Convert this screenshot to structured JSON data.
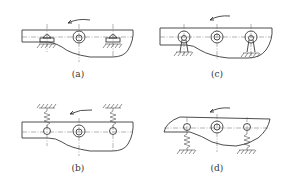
{
  "figure": {
    "panels": [
      {
        "id": "a",
        "label": "(a)",
        "support_type": "roller-on-ground",
        "rotation_arrow": "counterclockwise"
      },
      {
        "id": "b",
        "label": "(b)",
        "support_type": "spring-from-above",
        "rotation_arrow": "counterclockwise"
      },
      {
        "id": "c",
        "label": "(c)",
        "support_type": "pinned-link-to-ground",
        "rotation_arrow": "counterclockwise"
      },
      {
        "id": "d",
        "label": "(d)",
        "support_type": "spring-from-below",
        "rotation_arrow": "counterclockwise"
      }
    ]
  },
  "colors": {
    "line": "#3a3a3a",
    "background": "#ffffff"
  }
}
